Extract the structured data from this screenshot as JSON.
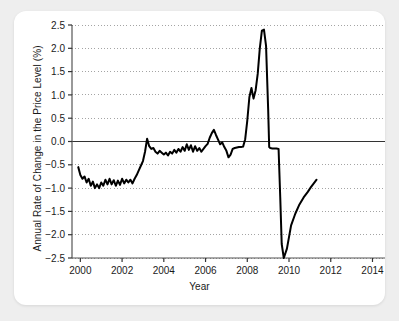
{
  "figure": {
    "background": "#eeeeee",
    "card_background": "#ffffff"
  },
  "chart_data": {
    "type": "line",
    "title": "",
    "xlabel": "Year",
    "ylabel": "Annual Rate of Change in the Price Level (%)",
    "xlim": [
      1999.6,
      2014.6
    ],
    "ylim": [
      -2.5,
      2.5
    ],
    "grid": true,
    "grid_style": "dotted-horizontal",
    "legend": "none",
    "line_color": "#000000",
    "line_width": 2.0,
    "zero_line": true,
    "zero_line_color": "#333333",
    "xticks": [
      2000,
      2002,
      2004,
      2006,
      2008,
      2010,
      2012,
      2014
    ],
    "xticklabels": [
      "2000",
      "2002",
      "2004",
      "2006",
      "2008",
      "2010",
      "2012",
      "2014"
    ],
    "yticks": [
      -2.5,
      -2.0,
      -1.5,
      -1.0,
      -0.5,
      0.0,
      0.5,
      1.0,
      1.5,
      2.0,
      2.5
    ],
    "yticklabels": [
      "−2.5",
      "−2.0",
      "−1.5",
      "−1.0",
      "−0.5",
      "0.0",
      "0.5",
      "1.0",
      "1.5",
      "2.0",
      "2.5"
    ],
    "series": [
      {
        "name": "Annual Rate of Change in the Price Level",
        "x": [
          1999.9,
          2000.0,
          2000.1,
          2000.2,
          2000.3,
          2000.4,
          2000.5,
          2000.6,
          2000.7,
          2000.8,
          2000.9,
          2001.0,
          2001.1,
          2001.2,
          2001.3,
          2001.4,
          2001.5,
          2001.6,
          2001.7,
          2001.8,
          2001.9,
          2002.0,
          2002.1,
          2002.2,
          2002.3,
          2002.4,
          2002.5,
          2002.6,
          2002.7,
          2002.8,
          2002.9,
          2003.0,
          2003.1,
          2003.2,
          2003.3,
          2003.4,
          2003.5,
          2003.6,
          2003.7,
          2003.8,
          2003.9,
          2004.0,
          2004.1,
          2004.2,
          2004.3,
          2004.4,
          2004.5,
          2004.6,
          2004.7,
          2004.8,
          2004.9,
          2005.0,
          2005.1,
          2005.2,
          2005.3,
          2005.4,
          2005.5,
          2005.6,
          2005.7,
          2005.8,
          2005.9,
          2006.0,
          2006.1,
          2006.2,
          2006.3,
          2006.4,
          2006.5,
          2006.6,
          2006.7,
          2006.8,
          2006.9,
          2007.0,
          2007.1,
          2007.2,
          2007.3,
          2007.4,
          2007.5,
          2007.6,
          2007.7,
          2007.8,
          2007.9,
          2008.0,
          2008.1,
          2008.2,
          2008.3,
          2008.4,
          2008.5,
          2008.6,
          2008.7,
          2008.8,
          2008.9,
          2009.0,
          2009.05,
          2009.1,
          2009.2,
          2009.3,
          2009.4,
          2009.5,
          2009.58,
          2009.65,
          2009.75,
          2009.9,
          2010.1,
          2010.3,
          2010.5,
          2010.7,
          2010.9,
          2011.05,
          2011.15,
          2011.25,
          2011.32
        ],
        "values": [
          -0.55,
          -0.72,
          -0.8,
          -0.75,
          -0.88,
          -0.8,
          -0.95,
          -0.86,
          -1.0,
          -0.92,
          -1.0,
          -0.88,
          -0.95,
          -0.82,
          -0.92,
          -0.8,
          -0.92,
          -0.83,
          -0.95,
          -0.84,
          -0.93,
          -0.8,
          -0.9,
          -0.82,
          -0.88,
          -0.82,
          -0.9,
          -0.8,
          -0.72,
          -0.62,
          -0.52,
          -0.42,
          -0.22,
          0.06,
          -0.1,
          -0.16,
          -0.14,
          -0.22,
          -0.26,
          -0.2,
          -0.24,
          -0.28,
          -0.24,
          -0.3,
          -0.22,
          -0.26,
          -0.18,
          -0.24,
          -0.16,
          -0.22,
          -0.12,
          -0.2,
          -0.06,
          -0.18,
          -0.08,
          -0.22,
          -0.1,
          -0.2,
          -0.14,
          -0.22,
          -0.16,
          -0.1,
          -0.05,
          0.08,
          0.18,
          0.25,
          0.14,
          0.04,
          -0.06,
          -0.02,
          -0.12,
          -0.2,
          -0.34,
          -0.28,
          -0.16,
          -0.14,
          -0.13,
          -0.12,
          -0.12,
          -0.11,
          0.05,
          0.45,
          0.95,
          1.15,
          0.92,
          1.1,
          1.45,
          2.0,
          2.38,
          2.4,
          2.05,
          0.7,
          -0.12,
          -0.14,
          -0.15,
          -0.15,
          -0.15,
          -0.16,
          -1.2,
          -2.2,
          -2.5,
          -2.3,
          -1.8,
          -1.55,
          -1.35,
          -1.2,
          -1.08,
          -0.98,
          -0.92,
          -0.86,
          -0.82
        ]
      }
    ]
  }
}
